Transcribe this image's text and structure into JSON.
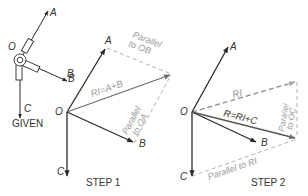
{
  "colors": {
    "vector": "#2a2a2a",
    "resultant": "#6e6e6e",
    "construction": "#a8a8a8",
    "background": "#ffffff"
  },
  "given": {
    "caption": "GIVEN",
    "labels": {
      "origin": "O",
      "a": "A",
      "b": "B",
      "c": "C"
    }
  },
  "step1": {
    "caption": "STEP 1",
    "labels": {
      "origin": "O",
      "a": "A",
      "b": "B",
      "b_top": "B",
      "c": "C",
      "resultant": "RI=A+B",
      "parallel_ob_1": "Parallel",
      "parallel_ob_2": "to OB",
      "parallel_oa_1": "Parallel",
      "parallel_oa_2": "to OA"
    }
  },
  "step2": {
    "caption": "STEP 2",
    "labels": {
      "origin": "O",
      "a": "A",
      "b": "B",
      "c": "C",
      "r1": "RI",
      "resultant": "R=RI+C",
      "parallel_oc_1": "Parallel",
      "parallel_oc_2": "to OC",
      "parallel_r1": "Parallel to RI"
    }
  }
}
